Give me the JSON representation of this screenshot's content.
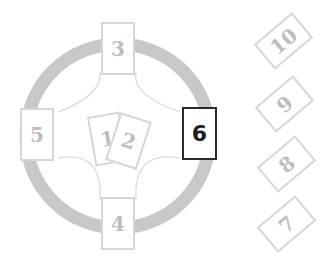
{
  "diagram": {
    "colors": {
      "ring": "#c8c8c8",
      "card_border": "#d6d6d6",
      "card_text": "#bdbdbd",
      "active_border": "#2a2a2a",
      "active_text": "#1e1e1e"
    },
    "cards": [
      {
        "position": "1",
        "label": "1",
        "x": 91,
        "y": 114,
        "w": 33,
        "h": 50,
        "rotate": -10,
        "active": false
      },
      {
        "position": "2",
        "label": "2",
        "x": 112,
        "y": 116,
        "w": 33,
        "h": 50,
        "rotate": 18,
        "active": false
      },
      {
        "position": "3",
        "label": "3",
        "x": 101,
        "y": 22,
        "w": 34,
        "h": 53,
        "rotate": 0,
        "active": false
      },
      {
        "position": "4",
        "label": "4",
        "x": 101,
        "y": 197,
        "w": 34,
        "h": 53,
        "rotate": 0,
        "active": false
      },
      {
        "position": "5",
        "label": "5",
        "x": 20,
        "y": 108,
        "w": 34,
        "h": 53,
        "rotate": 0,
        "active": false
      },
      {
        "position": "6",
        "label": "6",
        "x": 182,
        "y": 107,
        "w": 35,
        "h": 53,
        "rotate": 0,
        "active": true
      },
      {
        "position": "7",
        "label": "7",
        "x": 270,
        "y": 199,
        "w": 33,
        "h": 50,
        "rotate": 50,
        "active": false
      },
      {
        "position": "8",
        "label": "8",
        "x": 270,
        "y": 139,
        "w": 33,
        "h": 50,
        "rotate": 50,
        "active": false
      },
      {
        "position": "9",
        "label": "9",
        "x": 268,
        "y": 79,
        "w": 33,
        "h": 50,
        "rotate": 50,
        "active": false
      },
      {
        "position": "10",
        "label": "10",
        "x": 267,
        "y": 16,
        "w": 33,
        "h": 50,
        "rotate": 50,
        "active": false
      }
    ]
  }
}
